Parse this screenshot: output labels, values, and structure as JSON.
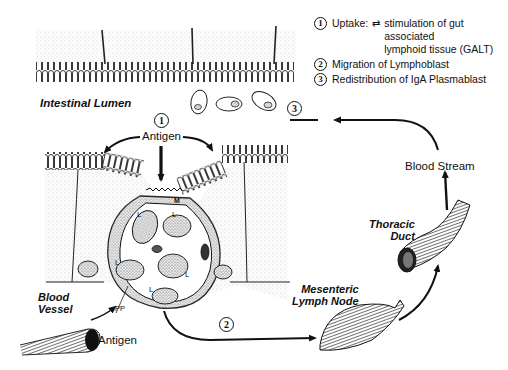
{
  "legend": {
    "items": [
      {
        "number": "1",
        "text": "Uptake",
        "arrow": "bidirectional-arrow",
        "detail_line1": "stimulation of gut associated",
        "detail_line2": "lymphoid tissue (GALT)"
      },
      {
        "number": "2",
        "text": "Migration of Lymphoblast"
      },
      {
        "number": "3",
        "text": "Redistribution of IgA Plasmablast"
      }
    ]
  },
  "labels": {
    "intestinal_lumen": "Intestinal Lumen",
    "antigen_top": "Antigen",
    "antigen_bottom": "Antigen",
    "blood_vessel_line1": "Blood",
    "blood_vessel_line2": "Vessel",
    "pp": "PP",
    "m_cell": "M",
    "lymphocyte": "L",
    "mesenteric_line1": "Mesenteric",
    "mesenteric_line2": "Lymph Node",
    "thoracic_line1": "Thoracic",
    "thoracic_line2": "Duct",
    "blood_stream": "Blood Stream"
  },
  "steps": {
    "step1": "1",
    "step2": "2",
    "step3": "3"
  },
  "colors": {
    "ink": "#111111",
    "stipple": "#d6d6d6",
    "background": "#ffffff"
  }
}
